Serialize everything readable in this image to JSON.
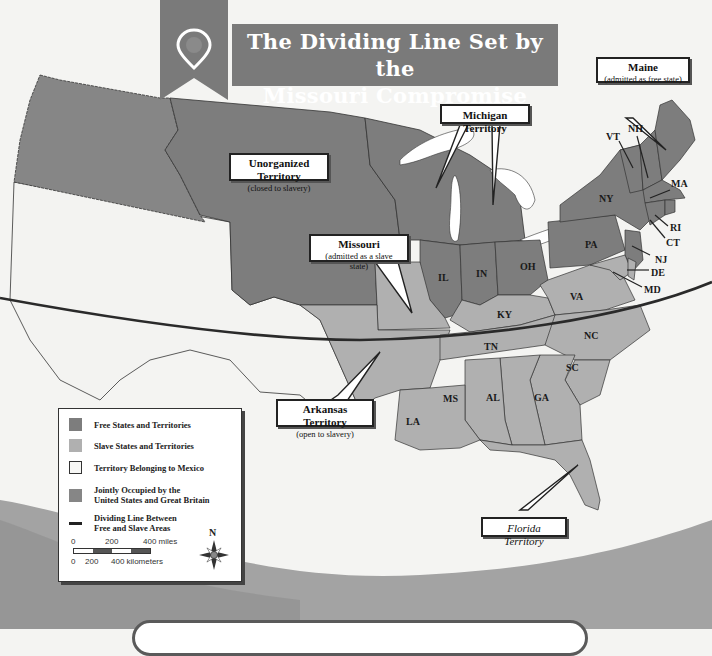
{
  "title": {
    "line1": "The Dividing Line Set by the",
    "line2": "Missouri Compromise",
    "icon": "map-pin-icon"
  },
  "callouts": {
    "maine": {
      "name": "Maine",
      "note": "(admitted as free state)"
    },
    "michigan": {
      "name": "Michigan Territory"
    },
    "unorganized": {
      "name": "Unorganized Territory",
      "note": "(closed to slavery)"
    },
    "missouri": {
      "name": "Missouri",
      "note": "(admitted as a slave state)"
    },
    "arkansas": {
      "name": "Arkansas Territory",
      "note": "(open to slavery)"
    },
    "florida": {
      "name": "Florida Territory"
    }
  },
  "states": {
    "free": [
      "IL",
      "IN",
      "OH",
      "PA",
      "NY",
      "VT",
      "NH",
      "MA",
      "RI",
      "CT",
      "NJ"
    ],
    "slave": [
      "KY",
      "VA",
      "NC",
      "TN",
      "SC",
      "GA",
      "AL",
      "MS",
      "LA",
      "DE",
      "MD"
    ]
  },
  "state_labels": {
    "IL": "IL",
    "IN": "IN",
    "OH": "OH",
    "PA": "PA",
    "NY": "NY",
    "VT": "VT",
    "NH": "NH",
    "MA": "MA",
    "RI": "RI",
    "CT": "CT",
    "NJ": "NJ",
    "DE": "DE",
    "MD": "MD",
    "VA": "VA",
    "KY": "KY",
    "NC": "NC",
    "TN": "TN",
    "SC": "SC",
    "GA": "GA",
    "AL": "AL",
    "MS": "MS",
    "LA": "LA"
  },
  "legend": {
    "items": [
      {
        "label": "Free States and Territories",
        "color": "#7d7d7d",
        "kind": "swatch"
      },
      {
        "label": "Slave States and Territories",
        "color": "#b0b0b0",
        "kind": "swatch"
      },
      {
        "label": "Territory Belonging to Mexico",
        "color": "#f7f7f5",
        "kind": "swatch-outline"
      },
      {
        "label": "Jointly Occupied by the United States and Great Britain",
        "line1": "Jointly Occupied by the",
        "line2": "United States and Great Britain",
        "color": "#868686",
        "kind": "swatch"
      },
      {
        "label": "Dividing Line Between Free and Slave Areas",
        "line1": "Dividing Line Between",
        "line2": "Free and Slave Areas",
        "color": "#222222",
        "kind": "line"
      }
    ],
    "scale": {
      "miles": {
        "ticks": [
          "0",
          "200",
          "400 miles"
        ]
      },
      "kilometers": {
        "ticks": [
          "0",
          "200",
          "400 kilometers"
        ]
      }
    },
    "compass": {
      "label": "N",
      "icon": "compass-rose-icon"
    }
  },
  "colors": {
    "free": "#7d7d7d",
    "slave": "#b0b0b0",
    "mexico": "#f3f3f1",
    "joint": "#868686",
    "dividing_line": "#2a2a2a",
    "banner": "#7a7a7a",
    "water": "#ffffff"
  }
}
